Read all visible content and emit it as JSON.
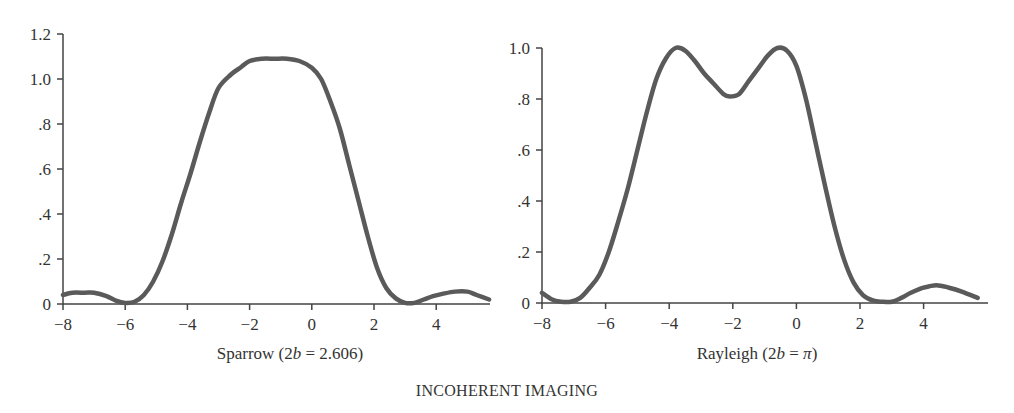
{
  "figure_title": "INCOHERENT IMAGING",
  "chart_data": [
    {
      "type": "line",
      "title": "Sparrow (2b = 2.606)",
      "caption_parts": {
        "prefix": "Sparrow (2",
        "italic": "b",
        "suffix": " = 2.606)"
      },
      "xlabel": "",
      "ylabel": "",
      "xlim": [
        -8,
        5.7
      ],
      "ylim": [
        0,
        1.2
      ],
      "x_ticks": [
        -8,
        -6,
        -4,
        -2,
        0,
        2,
        4
      ],
      "x_tick_labels": [
        "−8",
        "−6",
        "−4",
        "−2",
        "0",
        "2",
        "4"
      ],
      "y_ticks": [
        0,
        0.2,
        0.4,
        0.6,
        0.8,
        1.0,
        1.2
      ],
      "y_tick_labels": [
        "0",
        ".2",
        ".4",
        ".6",
        ".8",
        "1.0",
        "1.2"
      ],
      "grid": false,
      "series": [
        {
          "name": "intensity",
          "x": [
            -8.0,
            -7.7,
            -7.3,
            -7.0,
            -6.6,
            -6.3,
            -6.0,
            -5.7,
            -5.4,
            -5.1,
            -4.8,
            -4.5,
            -4.2,
            -3.9,
            -3.6,
            -3.3,
            -3.0,
            -2.6,
            -2.3,
            -2.0,
            -1.6,
            -1.2,
            -0.8,
            -0.4,
            0.0,
            0.3,
            0.6,
            0.9,
            1.2,
            1.5,
            1.8,
            2.1,
            2.4,
            2.7,
            3.0,
            3.3,
            3.6,
            3.9,
            4.2,
            4.6,
            5.0,
            5.3,
            5.7
          ],
          "y": [
            0.04,
            0.05,
            0.05,
            0.05,
            0.035,
            0.015,
            0.005,
            0.01,
            0.04,
            0.1,
            0.19,
            0.31,
            0.45,
            0.58,
            0.72,
            0.85,
            0.96,
            1.02,
            1.05,
            1.08,
            1.09,
            1.09,
            1.09,
            1.08,
            1.05,
            1.0,
            0.9,
            0.78,
            0.62,
            0.46,
            0.3,
            0.16,
            0.07,
            0.025,
            0.005,
            0.005,
            0.02,
            0.035,
            0.045,
            0.055,
            0.055,
            0.04,
            0.02
          ]
        }
      ]
    },
    {
      "type": "line",
      "title": "Rayleigh (2b = π)",
      "caption_parts": {
        "prefix": "Rayleigh (2",
        "italic": "b",
        "mid": " = ",
        "italic2": "π",
        "suffix": ")"
      },
      "xlabel": "",
      "ylabel": "",
      "xlim": [
        -8,
        5.7
      ],
      "ylim": [
        0,
        1.0
      ],
      "x_ticks": [
        -8,
        -6,
        -4,
        -2,
        0,
        2,
        4
      ],
      "x_tick_labels": [
        "−8",
        "−6",
        "−4",
        "−2",
        "0",
        "2",
        "4"
      ],
      "y_ticks": [
        0,
        0.2,
        0.4,
        0.6,
        0.8,
        1.0
      ],
      "y_tick_labels": [
        "0",
        ".2",
        ".4",
        ".6",
        ".8",
        "1.0"
      ],
      "grid": false,
      "series": [
        {
          "name": "intensity",
          "x": [
            -8.0,
            -7.7,
            -7.4,
            -7.1,
            -6.8,
            -6.5,
            -6.2,
            -5.9,
            -5.6,
            -5.3,
            -5.0,
            -4.7,
            -4.4,
            -4.1,
            -3.8,
            -3.5,
            -3.2,
            -2.9,
            -2.6,
            -2.3,
            -2.1,
            -1.8,
            -1.5,
            -1.2,
            -0.9,
            -0.6,
            -0.3,
            0.0,
            0.3,
            0.6,
            0.9,
            1.2,
            1.5,
            1.8,
            2.1,
            2.4,
            2.7,
            3.0,
            3.3,
            3.6,
            4.0,
            4.4,
            4.8,
            5.2,
            5.7
          ],
          "y": [
            0.04,
            0.015,
            0.005,
            0.005,
            0.02,
            0.06,
            0.11,
            0.2,
            0.32,
            0.45,
            0.6,
            0.75,
            0.88,
            0.96,
            1.0,
            0.99,
            0.95,
            0.9,
            0.86,
            0.82,
            0.81,
            0.82,
            0.87,
            0.92,
            0.97,
            1.0,
            0.99,
            0.93,
            0.8,
            0.63,
            0.46,
            0.3,
            0.17,
            0.08,
            0.03,
            0.01,
            0.005,
            0.005,
            0.02,
            0.04,
            0.06,
            0.07,
            0.06,
            0.045,
            0.02
          ]
        }
      ]
    }
  ]
}
